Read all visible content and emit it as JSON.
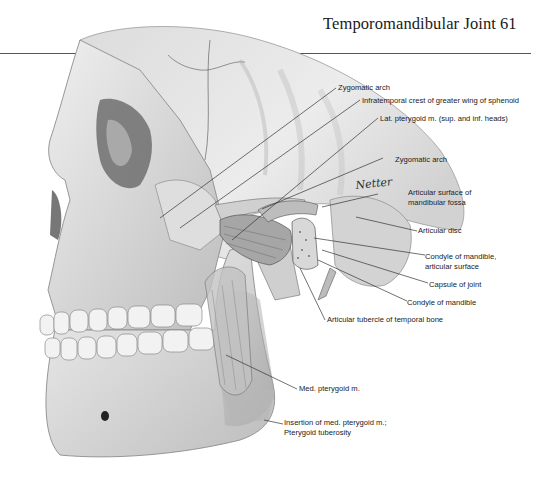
{
  "header": {
    "title": "Temporomandibular Joint",
    "page_number": "61"
  },
  "figure": {
    "signature": "Netter-style signature (cursive)",
    "labels": [
      {
        "id": "zygomatic-arch-upper",
        "text": "Zygomatic arch"
      },
      {
        "id": "infratemporal-crest",
        "text": "Infratemporal crest of greater wing of sphenoid"
      },
      {
        "id": "lat-pterygoid",
        "text": "Lat. pterygoid m. (sup. and inf. heads)"
      },
      {
        "id": "zygomatic-arch-lower",
        "text": "Zygomatic arch"
      },
      {
        "id": "articular-surface-fossa-1",
        "text": "Articular surface of"
      },
      {
        "id": "articular-surface-fossa-2",
        "text": "mandibular fossa"
      },
      {
        "id": "articular-disc",
        "text": "Articular disc"
      },
      {
        "id": "condyle-articular-1",
        "text": "Condyle of mandible,"
      },
      {
        "id": "condyle-articular-2",
        "text": "articular surface"
      },
      {
        "id": "capsule-of-joint",
        "text": "Capsule of joint"
      },
      {
        "id": "condyle-of-mandible",
        "text": "Condyle of mandible"
      },
      {
        "id": "articular-tubercle",
        "text": "Articular tubercle of temporal bone"
      },
      {
        "id": "med-pterygoid",
        "text": "Med. pterygoid m."
      },
      {
        "id": "insertion-med-pterygoid-1",
        "text": "Insertion of med. pterygoid m.;"
      },
      {
        "id": "insertion-med-pterygoid-2",
        "text": "Pterygoid tuberosity"
      }
    ]
  },
  "colors": {
    "ink": "#222222",
    "rule": "#555555",
    "bone_light": "#e6e6e6",
    "bone_mid": "#c9c9c9",
    "shadow": "#8a8a8a"
  }
}
